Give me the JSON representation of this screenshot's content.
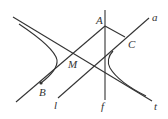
{
  "diagram": {
    "type": "geometry-hyperbola",
    "stroke_color": "#333333",
    "background": "#ffffff",
    "points": {
      "A": {
        "label": "A",
        "x": 105,
        "y": 26
      },
      "B": {
        "label": "B",
        "x": 41,
        "y": 83
      },
      "C": {
        "label": "C",
        "x": 125,
        "y": 37
      },
      "M": {
        "label": "M",
        "x": 73,
        "y": 54
      }
    },
    "lines": {
      "a": {
        "label": "a"
      },
      "l": {
        "label": "l"
      },
      "f": {
        "label": "f"
      },
      "t": {
        "label": "t"
      }
    }
  }
}
